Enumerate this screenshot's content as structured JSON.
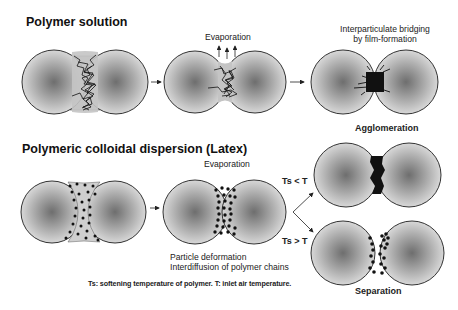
{
  "sections": {
    "solution": {
      "title": "Polymer solution",
      "step2_label": "Evaporation",
      "step3_label_line1": "Interparticulate bridging",
      "step3_label_line2": "by film-formation",
      "outcome": "Agglomeration"
    },
    "latex": {
      "title": "Polymeric colloidal dispersion (Latex)",
      "step2_label": "Evaporation",
      "step2_note_line1": "Particle deformation",
      "step2_note_line2": "Interdiffusion of polymer chains",
      "branch_upper": "Ts < T",
      "branch_lower": "Ts > T",
      "outcome": "Separation"
    }
  },
  "caption": "Ts: softening temperature of polymer. T: inlet air temperature.",
  "colors": {
    "particle_center": "#6e6e6e",
    "particle_edge": "#d8d8d8",
    "outline": "#3a3a3a",
    "bridge_fill": "#c4c4c4",
    "polymer": "#111111"
  },
  "icons": {
    "arrow": "right-arrow",
    "evaporation_arrows": "up-arrows",
    "branch": "fork-arrow"
  }
}
